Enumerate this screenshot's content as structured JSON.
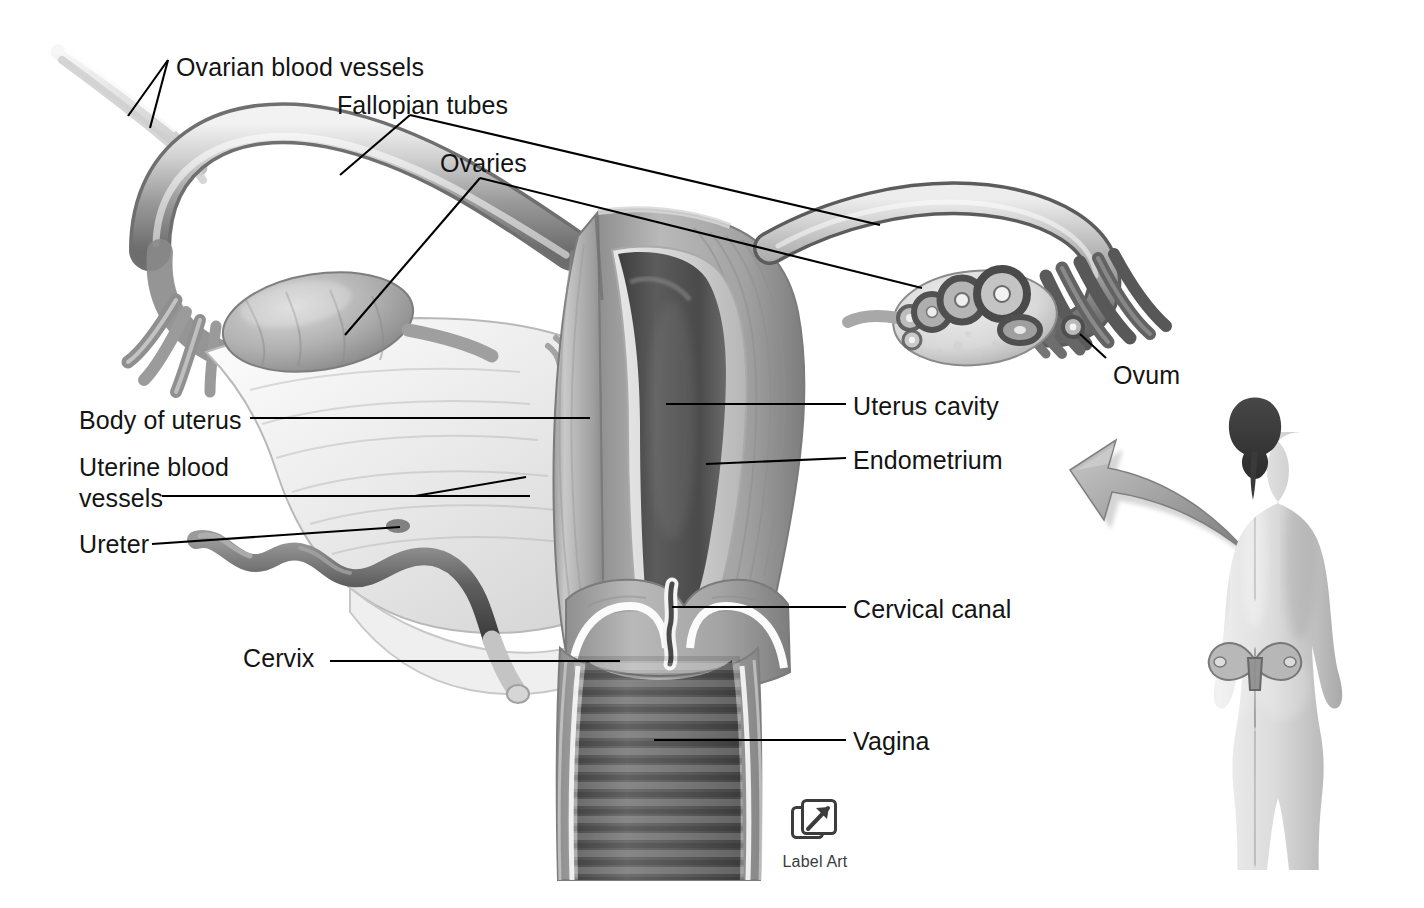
{
  "figure": {
    "background_color": "#ffffff",
    "label_color": "#141414",
    "leader_color": "#000000",
    "style": "grayscale medical illustration"
  },
  "labels": [
    {
      "id": "ovarian-blood-vessels",
      "text": "Ovarian blood vessels",
      "x": 176,
      "y": 52,
      "align": "left",
      "lines": 1
    },
    {
      "id": "fallopian-tubes",
      "text": "Fallopian tubes",
      "x": 337,
      "y": 90,
      "align": "left",
      "lines": 1
    },
    {
      "id": "ovaries",
      "text": "Ovaries",
      "x": 440,
      "y": 148,
      "align": "left",
      "lines": 1
    },
    {
      "id": "ovum",
      "text": "Ovum",
      "x": 1113,
      "y": 360,
      "align": "left",
      "lines": 1
    },
    {
      "id": "uterus-cavity",
      "text": "Uterus cavity",
      "x": 853,
      "y": 391,
      "align": "left",
      "lines": 1
    },
    {
      "id": "endometrium",
      "text": "Endometrium",
      "x": 853,
      "y": 445,
      "align": "left",
      "lines": 1
    },
    {
      "id": "body-of-uterus",
      "text": "Body of uterus",
      "x": 79,
      "y": 405,
      "align": "left",
      "lines": 1
    },
    {
      "id": "uterine-blood-vessels",
      "text": "Uterine blood vessels",
      "x": 79,
      "y": 452,
      "align": "left",
      "lines": 2
    },
    {
      "id": "ureter",
      "text": "Ureter",
      "x": 79,
      "y": 529,
      "align": "left",
      "lines": 1
    },
    {
      "id": "cervical-canal",
      "text": "Cervical canal",
      "x": 853,
      "y": 594,
      "align": "left",
      "lines": 1
    },
    {
      "id": "cervix",
      "text": "Cervix",
      "x": 243,
      "y": 643,
      "align": "left",
      "lines": 1
    },
    {
      "id": "vagina",
      "text": "Vagina",
      "x": 853,
      "y": 726,
      "align": "left",
      "lines": 1
    }
  ],
  "watermark": {
    "text": "Label Art",
    "icon": "arrow-up-right-in-square-icon",
    "x": 776,
    "y": 796
  },
  "anatomy_parts": [
    "left fallopian tube",
    "right fallopian tube",
    "left ovary",
    "right ovary with maturing follicles",
    "fimbriae",
    "ovum",
    "body of uterus",
    "uterine cavity",
    "endometrium",
    "myometrium",
    "broad ligament",
    "ovarian blood vessels",
    "uterine blood vessels",
    "ureter",
    "cervix",
    "cervical canal",
    "vagina with rugae"
  ],
  "inset": {
    "name": "female-body-posterior-view",
    "description": "Posterior view of a standing female figure with uterus position indicated in the pelvis",
    "arrow": "curved-arrow-pointing-upper-left"
  }
}
